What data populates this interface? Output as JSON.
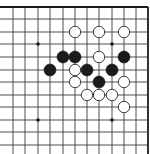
{
  "board": {
    "description": "Go board fragment (top-right corner region), 12 columns x 12 rows visible",
    "colors": {
      "background": "#ffffff",
      "line": "#3a3a3a",
      "black_stone": "#1b1b1b",
      "white_stone": "#ffffff"
    },
    "columns_x": [
      13,
      25,
      38,
      50,
      63,
      75,
      87,
      99,
      112,
      124,
      136,
      148
    ],
    "rows_y": [
      7,
      19,
      32,
      44,
      57,
      70,
      82,
      95,
      107,
      120,
      132,
      145
    ],
    "edges": {
      "top": true,
      "right": true,
      "left": false,
      "bottom": false
    },
    "stone_radius": 6,
    "star_points": [
      {
        "col": 2,
        "row": 3
      },
      {
        "col": 8,
        "row": 3
      },
      {
        "col": 2,
        "row": 9
      },
      {
        "col": 8,
        "row": 9
      }
    ],
    "stones": [
      {
        "color": "white",
        "col": 5,
        "row": 2
      },
      {
        "color": "white",
        "col": 7,
        "row": 2
      },
      {
        "color": "white",
        "col": 9,
        "row": 2
      },
      {
        "color": "black",
        "col": 4,
        "row": 4
      },
      {
        "color": "black",
        "col": 5,
        "row": 4
      },
      {
        "color": "white",
        "col": 7,
        "row": 4
      },
      {
        "color": "black",
        "col": 9,
        "row": 4
      },
      {
        "color": "black",
        "col": 3,
        "row": 5
      },
      {
        "color": "white",
        "col": 5,
        "row": 5
      },
      {
        "color": "black",
        "col": 6,
        "row": 5
      },
      {
        "color": "black",
        "col": 8,
        "row": 5
      },
      {
        "color": "white",
        "col": 5,
        "row": 6
      },
      {
        "color": "black",
        "col": 7,
        "row": 6
      },
      {
        "color": "white",
        "col": 9,
        "row": 6
      },
      {
        "color": "white",
        "col": 6,
        "row": 7
      },
      {
        "color": "white",
        "col": 7,
        "row": 7
      },
      {
        "color": "white",
        "col": 8,
        "row": 7
      },
      {
        "color": "white",
        "col": 9,
        "row": 8
      }
    ]
  }
}
